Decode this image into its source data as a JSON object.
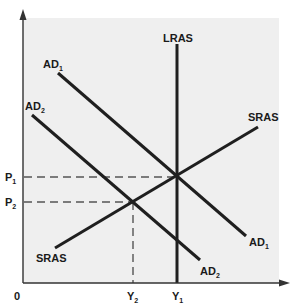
{
  "diagram": {
    "background_color": "#efefef",
    "line_color": "#1f1f1f",
    "dash_color": "#555555",
    "axes": {
      "origin_label": "0",
      "x_axis": {
        "label": "",
        "ticks": [
          {
            "main": "Y",
            "sub": "2"
          },
          {
            "main": "Y",
            "sub": "1"
          }
        ]
      },
      "y_axis": {
        "label": "",
        "ticks": [
          {
            "main": "P",
            "sub": "1"
          },
          {
            "main": "P",
            "sub": "2"
          }
        ]
      }
    },
    "curves": {
      "lras": {
        "label": "LRAS"
      },
      "sras": {
        "label_top": "SRAS",
        "label_bottom": "SRAS"
      },
      "ad1": {
        "main": "AD",
        "sub": "1"
      },
      "ad2": {
        "main": "AD",
        "sub": "2"
      }
    },
    "equilibria": [
      {
        "name": "E1",
        "price": "P1",
        "output": "Y1",
        "on": [
          "AD1",
          "SRAS",
          "LRAS"
        ]
      },
      {
        "name": "E2",
        "price": "P2",
        "output": "Y2",
        "on": [
          "AD2",
          "SRAS"
        ]
      }
    ]
  }
}
